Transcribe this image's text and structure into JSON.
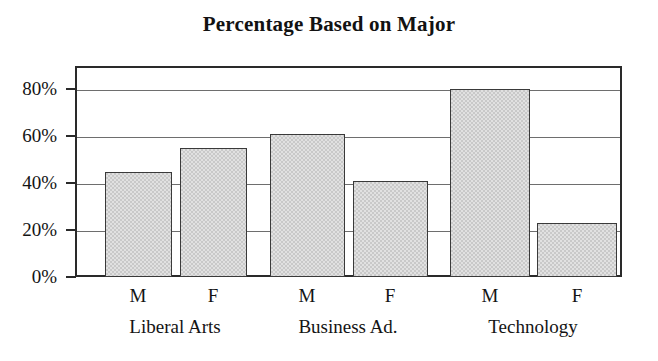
{
  "chart_data": {
    "type": "bar",
    "title": "Percentage Based on Major",
    "xlabel": "",
    "ylabel": "",
    "ylim": [
      0,
      90
    ],
    "y_ticks": [
      0,
      20,
      40,
      60,
      80
    ],
    "y_tick_labels": [
      "0%",
      "20%",
      "40%",
      "60%",
      "80%"
    ],
    "grid": true,
    "legend": "none",
    "categories": [
      "Liberal Arts",
      "Business Ad.",
      "Technology"
    ],
    "subcategories": [
      "M",
      "F"
    ],
    "bars": [
      {
        "group": "Liberal Arts",
        "series": "M",
        "value": 45
      },
      {
        "group": "Liberal Arts",
        "series": "F",
        "value": 55
      },
      {
        "group": "Business Ad.",
        "series": "M",
        "value": 61
      },
      {
        "group": "Business Ad.",
        "series": "F",
        "value": 41
      },
      {
        "group": "Technology",
        "series": "M",
        "value": 80
      },
      {
        "group": "Technology",
        "series": "F",
        "value": 23
      }
    ],
    "series": [
      {
        "name": "M",
        "values": [
          45,
          61,
          80
        ]
      },
      {
        "name": "F",
        "values": [
          55,
          41,
          23
        ]
      }
    ],
    "colors": {
      "bar_fill": "#c9c9c9",
      "bar_border": "#3a3a3a",
      "axis": "#2a2a2a",
      "gridline": "#6e6e6e",
      "text": "#141414",
      "background": "#ffffff"
    }
  },
  "layout": {
    "plot": {
      "left": 75,
      "top": 66,
      "width": 547,
      "height": 211
    },
    "bar_geometry": [
      {
        "x": 30,
        "width": 67
      },
      {
        "x": 105,
        "width": 67
      },
      {
        "x": 195,
        "width": 75
      },
      {
        "x": 278,
        "width": 75
      },
      {
        "x": 375,
        "width": 80
      },
      {
        "x": 462,
        "width": 80
      }
    ],
    "series_label_x": [
      63,
      138,
      232,
      315,
      415,
      502
    ],
    "group_label_x": [
      100,
      273,
      458
    ]
  }
}
